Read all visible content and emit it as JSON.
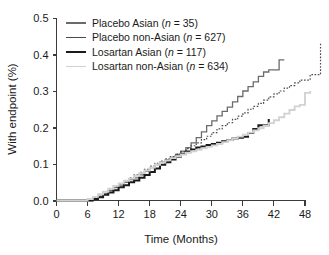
{
  "chart_data": {
    "type": "line",
    "title": "",
    "subtitle": "",
    "xlabel": "Time (Months)",
    "ylabel": "With endpoint (%)",
    "xlim": [
      0,
      52
    ],
    "ylim": [
      0.0,
      0.5
    ],
    "xticks": [
      0,
      6,
      12,
      18,
      24,
      30,
      36,
      42,
      48
    ],
    "xticklabels": [
      "0",
      "6",
      "12",
      "18",
      "24",
      "30",
      "36",
      "42",
      "48"
    ],
    "yticks": [
      0.0,
      0.1,
      0.2,
      0.3,
      0.4,
      0.5
    ],
    "yticklabels": [
      "0.0",
      "0.1",
      "0.2",
      "0.3",
      "0.4",
      "0.5"
    ],
    "grid": false,
    "legend_position": "upper-left-inside",
    "step_style": "post",
    "series": [
      {
        "name": "Placebo Asian",
        "legend_label": "Placebo Asian (n = 35)",
        "n": 35,
        "color": "#6b6b6b",
        "linestyle": "solid",
        "linewidth": 1.3,
        "x": [
          0,
          6,
          7,
          8,
          9,
          10,
          11,
          12,
          13,
          14,
          15,
          16,
          17,
          18,
          19,
          20,
          21,
          22,
          23,
          24,
          25,
          26,
          27,
          28,
          29,
          30,
          31,
          32,
          33,
          34,
          35,
          36,
          37,
          38,
          39,
          40,
          41,
          42,
          43,
          44
        ],
        "y": [
          0.0,
          0.0,
          0.005,
          0.012,
          0.018,
          0.027,
          0.035,
          0.042,
          0.05,
          0.057,
          0.062,
          0.07,
          0.08,
          0.09,
          0.098,
          0.105,
          0.112,
          0.118,
          0.126,
          0.135,
          0.145,
          0.158,
          0.172,
          0.188,
          0.205,
          0.218,
          0.232,
          0.244,
          0.256,
          0.27,
          0.285,
          0.3,
          0.312,
          0.325,
          0.34,
          0.352,
          0.358,
          0.358,
          0.385,
          0.385
        ]
      },
      {
        "name": "Placebo non-Asian",
        "legend_label": "Placebo non-Asian (n = 627)",
        "n": 627,
        "color": "#4a4a4a",
        "linestyle": "dotted",
        "linewidth": 1.2,
        "x": [
          0,
          5,
          6,
          7,
          8,
          9,
          10,
          11,
          12,
          13,
          14,
          15,
          16,
          17,
          18,
          19,
          20,
          21,
          22,
          23,
          24,
          25,
          26,
          27,
          28,
          29,
          30,
          31,
          32,
          33,
          34,
          35,
          36,
          37,
          38,
          39,
          40,
          41,
          42,
          43,
          44,
          45,
          46,
          47,
          48,
          49,
          50,
          51
        ],
        "y": [
          0.0,
          0.0,
          0.004,
          0.01,
          0.017,
          0.024,
          0.031,
          0.039,
          0.046,
          0.054,
          0.062,
          0.07,
          0.077,
          0.085,
          0.094,
          0.102,
          0.108,
          0.114,
          0.12,
          0.127,
          0.134,
          0.142,
          0.15,
          0.158,
          0.167,
          0.176,
          0.186,
          0.196,
          0.205,
          0.213,
          0.222,
          0.231,
          0.24,
          0.25,
          0.258,
          0.266,
          0.275,
          0.284,
          0.292,
          0.3,
          0.308,
          0.315,
          0.322,
          0.33,
          0.33,
          0.345,
          0.345,
          0.43
        ]
      },
      {
        "name": "Losartan Asian",
        "legend_label": "Losartan Asian (n = 117)",
        "n": 117,
        "color": "#1a1a1a",
        "linestyle": "solid",
        "linewidth": 2.0,
        "x": [
          0,
          6,
          7,
          8,
          9,
          10,
          11,
          12,
          13,
          14,
          15,
          16,
          17,
          18,
          19,
          20,
          21,
          22,
          23,
          24,
          25,
          26,
          27,
          28,
          29,
          30,
          31,
          32,
          33,
          34,
          35,
          36,
          37,
          38,
          39,
          40,
          41
        ],
        "y": [
          0.0,
          0.0,
          0.004,
          0.009,
          0.016,
          0.022,
          0.028,
          0.036,
          0.042,
          0.05,
          0.055,
          0.062,
          0.07,
          0.078,
          0.088,
          0.098,
          0.105,
          0.112,
          0.12,
          0.128,
          0.134,
          0.14,
          0.145,
          0.148,
          0.152,
          0.155,
          0.158,
          0.162,
          0.166,
          0.17,
          0.172,
          0.175,
          0.185,
          0.196,
          0.206,
          0.206,
          0.223
        ]
      },
      {
        "name": "Losartan non-Asian",
        "legend_label": "Losartan non-Asian (n = 634)",
        "n": 634,
        "color": "#d2d2d2",
        "linestyle": "solid",
        "linewidth": 1.9,
        "x": [
          0,
          5,
          6,
          7,
          8,
          9,
          10,
          11,
          12,
          13,
          14,
          15,
          16,
          17,
          18,
          19,
          20,
          21,
          22,
          23,
          24,
          25,
          26,
          27,
          28,
          29,
          30,
          31,
          32,
          33,
          34,
          35,
          36,
          37,
          38,
          39,
          40,
          41,
          42,
          43,
          44,
          45,
          46,
          47,
          48,
          49
        ],
        "y": [
          0.0,
          0.0,
          0.004,
          0.01,
          0.017,
          0.024,
          0.032,
          0.04,
          0.047,
          0.054,
          0.06,
          0.068,
          0.075,
          0.082,
          0.09,
          0.098,
          0.104,
          0.11,
          0.116,
          0.121,
          0.126,
          0.131,
          0.135,
          0.139,
          0.143,
          0.147,
          0.151,
          0.155,
          0.16,
          0.165,
          0.17,
          0.175,
          0.18,
          0.186,
          0.192,
          0.198,
          0.205,
          0.212,
          0.22,
          0.228,
          0.238,
          0.248,
          0.258,
          0.262,
          0.295,
          0.3
        ]
      }
    ]
  },
  "legend": {
    "entries": [
      "Placebo Asian (n = 35)",
      "Placebo non-Asian (n = 627)",
      "Losartan Asian (n = 117)",
      "Losartan non-Asian (n = 634)"
    ]
  }
}
